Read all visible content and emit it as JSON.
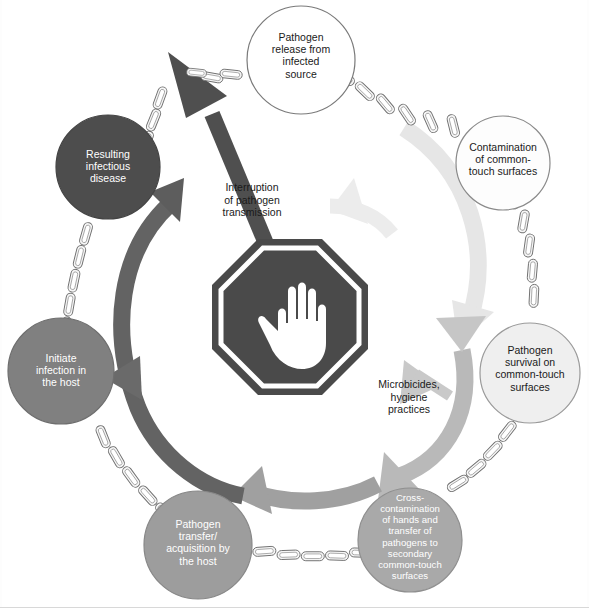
{
  "diagram": {
    "nodes": [
      {
        "id": "pathogen-release",
        "label": "Pathogen\nrelease from\ninfected\nsource",
        "cx": 301,
        "cy": 60,
        "r": 54,
        "fill": "#ffffff",
        "stroke": "#7a7a7a",
        "text_color": "#1a1a1a"
      },
      {
        "id": "contamination-surfaces",
        "label": "Contamination\nof common-\ntouch surfaces",
        "cx": 503,
        "cy": 163,
        "r": 47,
        "fill": "#fdfdfd",
        "stroke": "#8a8a8a",
        "text_color": "#1a1a1a"
      },
      {
        "id": "pathogen-survival",
        "label": "Pathogen\nsurvival on\ncommon-touch\nsurfaces",
        "cx": 530,
        "cy": 373,
        "r": 50,
        "fill": "#efefef",
        "stroke": "#9a9a9a",
        "text_color": "#1a1a1a"
      },
      {
        "id": "cross-contamination",
        "label": "Cross-\ncontamination\nof hands and\ntransfer of\npathogens to\nsecondary\ncommon-touch\nsurfaces",
        "cx": 410,
        "cy": 540,
        "r": 52,
        "fill": "#a9a9a9",
        "stroke": "#8f8f8f",
        "text_color": "#ffffff"
      },
      {
        "id": "pathogen-transfer",
        "label": "Pathogen\ntransfer/\nacquisition by\nthe host",
        "cx": 198,
        "cy": 545,
        "r": 54,
        "fill": "#9d9d9d",
        "stroke": "#888888",
        "text_color": "#ffffff"
      },
      {
        "id": "initiate-infection",
        "label": "Initiate\ninfection in\nthe host",
        "cx": 61,
        "cy": 371,
        "r": 53,
        "fill": "#808080",
        "stroke": "#6e6e6e",
        "text_color": "#ffffff"
      },
      {
        "id": "resulting-disease",
        "label": "Resulting\ninfectious\ndisease",
        "cx": 108,
        "cy": 167,
        "r": 52,
        "fill": "#4d4d4d",
        "stroke": "#444444",
        "text_color": "#ffffff"
      }
    ],
    "center_icon": {
      "id": "stop-hand-sign",
      "name": "stop-hand-icon",
      "cx": 290,
      "cy": 317,
      "outer_r": 78,
      "sign_color": "#4a4a4a",
      "hand_color": "#ffffff",
      "ring_color": "#ffffff"
    },
    "annotations": [
      {
        "id": "interruption-label",
        "label": "Interruption\nof pathogen\ntransmission",
        "x": 243,
        "y": 181,
        "color": "#1a1a1a"
      },
      {
        "id": "microbicides-label",
        "label": "Microbicides,\nhygiene\npractices",
        "x": 406,
        "y": 378,
        "color": "#1a1a1a"
      }
    ],
    "arrows": [
      {
        "id": "interruption-arrow",
        "name": "interruption-arrow",
        "from": "stop-sign",
        "to": "pathogen-release",
        "color": "#4f4f4f",
        "style": "straight-thick"
      },
      {
        "id": "left-cycle-arrow",
        "name": "left-cycle-double-arrow",
        "from": "initiate-infection",
        "to": "resulting-disease",
        "color": "#5f5f5f",
        "style": "curved-double"
      },
      {
        "id": "right-cycle-arrow",
        "name": "right-cycle-light-arrow",
        "from": "contamination-surfaces",
        "to": "cross-contamination",
        "color": "#e4e4e4",
        "style": "curved-double-light"
      },
      {
        "id": "microbicides-arrow",
        "name": "microbicides-arrow",
        "from": "stop-sign",
        "to": "cycle",
        "color": "#c9c9c9",
        "style": "short-straight"
      },
      {
        "id": "bottom-cycle-arrow",
        "name": "bottom-cycle-arrow",
        "from": "cross-contamination",
        "to": "pathogen-transfer",
        "color": "#9d9d9d",
        "style": "curved-single"
      }
    ],
    "chain": {
      "name": "chain-link",
      "link_stroke": "#6e6e6e",
      "link_fill": "#f4f4f4",
      "description": "metal chain links connecting adjacent circles around the ring"
    },
    "colors": {
      "background": "#ffffff",
      "text_dark": "#1a1a1a",
      "text_light": "#ffffff",
      "arrow_dark": "#4f4f4f",
      "arrow_mid": "#9d9d9d",
      "arrow_light": "#e4e4e4"
    }
  }
}
